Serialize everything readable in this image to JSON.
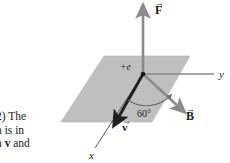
{
  "figure": {
    "kind": "physics-vector-diagram",
    "colors": {
      "plane_fill": "#bfbfbf",
      "plane_stroke": "#a8a8a8",
      "gray_vector": "#8a8a8a",
      "black_vector": "#1a1a1a",
      "thin_axis": "#8a8a8a",
      "text": "#1a1a1a",
      "background": "#ffffff"
    },
    "charge_label": "+e",
    "angle_label": "60°",
    "force_label": "F",
    "field_label": "B",
    "velocity_label": "v",
    "axis_y_label": "y",
    "axis_x_label": "x",
    "vector_arrow_overbar": "→"
  },
  "caption": {
    "line1": "2) The",
    "line2": "n is in",
    "line3_pre": "n ",
    "line3_vec": "v",
    "line3_post": " and"
  }
}
